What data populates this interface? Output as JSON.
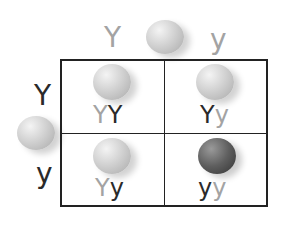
{
  "punnett": {
    "top": {
      "allele_left": "Y",
      "allele_right": "y",
      "pea": "light"
    },
    "left": {
      "allele_top": "Y",
      "allele_bottom": "y",
      "pea": "light"
    },
    "cells": [
      {
        "pos": "top-left",
        "pea": "light",
        "a1": "Y",
        "a2": "Y"
      },
      {
        "pos": "top-right",
        "pea": "light",
        "a1": "Y",
        "a2": "y"
      },
      {
        "pos": "bottom-left",
        "pea": "light",
        "a1": "Y",
        "a2": "y"
      },
      {
        "pos": "bottom-right",
        "pea": "dark",
        "a1": "y",
        "a2": "y"
      }
    ],
    "colors": {
      "dark_allele": "#2a2a2a",
      "light_allele": "#a3a3a3",
      "grid": "#222222"
    }
  }
}
